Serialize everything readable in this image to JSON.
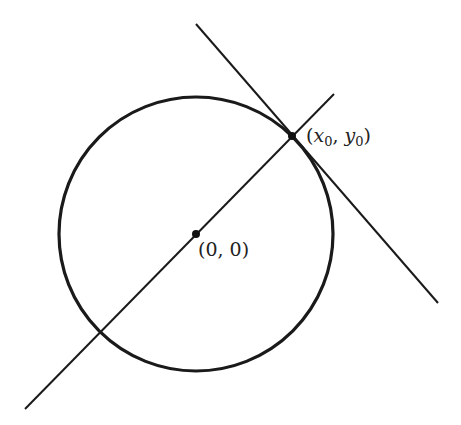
{
  "diagram": {
    "circle": {
      "cx": 196,
      "cy": 234,
      "r": 137,
      "stroke": "#1a1a1a"
    },
    "radial_line": {
      "x1": 25,
      "y1": 409,
      "x2": 334,
      "y2": 94
    },
    "tangent_line": {
      "x1": 196,
      "y1": 24,
      "x2": 438,
      "y2": 303
    },
    "points": [
      {
        "id": "origin",
        "x": 196,
        "y": 234,
        "label": "(0, 0)"
      },
      {
        "id": "tangent_point",
        "x": 292,
        "y": 136,
        "label": "(x0, y0)"
      }
    ],
    "labels": {
      "origin": {
        "open": "(",
        "text": "0, 0",
        "close": ")"
      },
      "tangent_point": {
        "open": "(",
        "x": "x",
        "x_sub": "0",
        "comma": ", ",
        "y": "y",
        "y_sub": "0",
        "close": ")"
      }
    }
  }
}
